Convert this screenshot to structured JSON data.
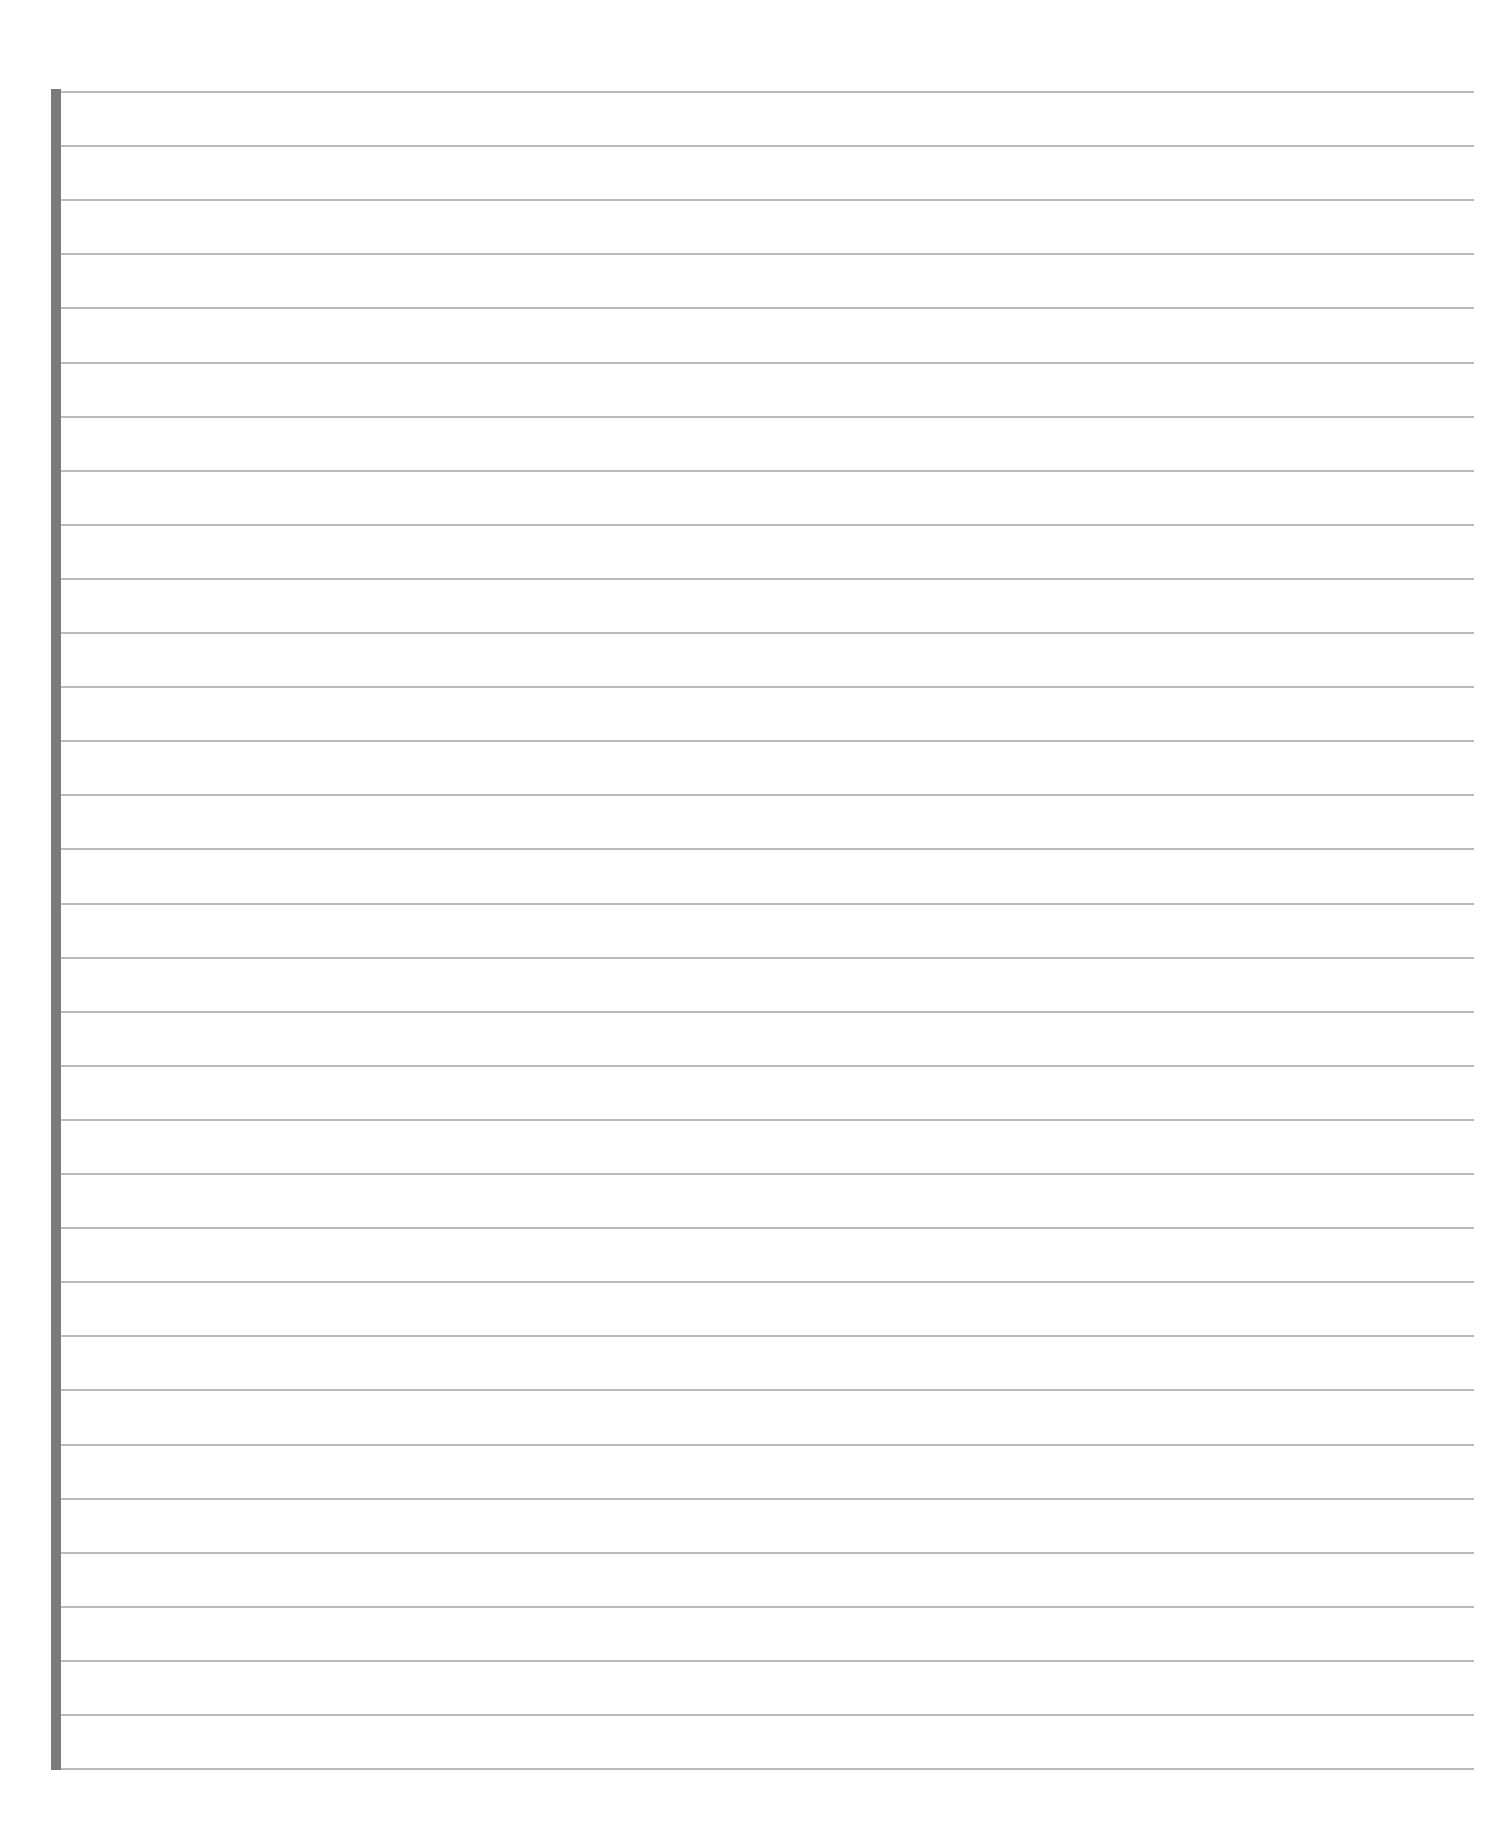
{
  "page": {
    "type": "lined-paper",
    "background_color": "#ffffff",
    "margin_bar_color": "#7b7b7b",
    "rule_color": "#b4b4b4",
    "rule_count": 32,
    "first_rule_y": 91,
    "rule_spacing": 54.1
  }
}
